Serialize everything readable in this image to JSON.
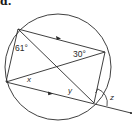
{
  "part_label": "d.",
  "diagram": {
    "type": "circle-theorem",
    "circle": {
      "cx": 58,
      "cy": 67,
      "r": 53
    },
    "points": {
      "A": {
        "x": 18,
        "y": 29
      },
      "B": {
        "x": 105,
        "y": 52
      },
      "C": {
        "x": 6,
        "y": 82
      },
      "D": {
        "x": 94,
        "y": 103
      },
      "E": {
        "x": 131,
        "y": 113
      }
    },
    "labels": {
      "angle_a": "61°",
      "angle_b": "30°",
      "x": "x",
      "y": "y",
      "z": "z"
    },
    "colors": {
      "stroke": "#2a2a2a",
      "background": "#ffffff"
    }
  }
}
